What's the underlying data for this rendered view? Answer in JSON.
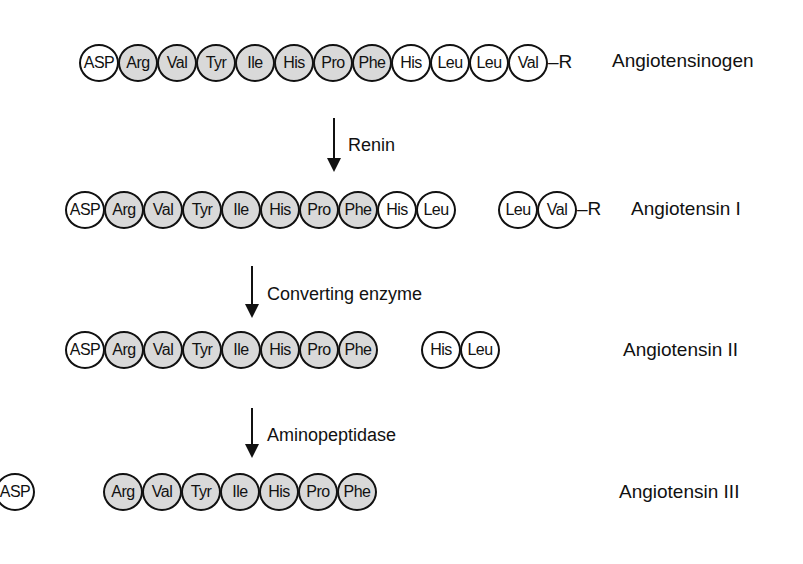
{
  "rows": [
    {
      "name": "Angiotensinogen",
      "label": "Angiotensinogen",
      "segments": [
        {
          "residues": [
            "ASP",
            "Arg",
            "Val",
            "Tyr",
            "Ile",
            "His",
            "Pro",
            "Phe",
            "His",
            "Leu",
            "Leu",
            "Val"
          ],
          "shaded": [
            false,
            true,
            true,
            true,
            true,
            true,
            true,
            true,
            false,
            false,
            false,
            false
          ],
          "tail": "–R"
        }
      ]
    },
    {
      "name": "Angiotensin I",
      "label": "Angiotensin I",
      "segments": [
        {
          "residues": [
            "ASP",
            "Arg",
            "Val",
            "Tyr",
            "Ile",
            "His",
            "Pro",
            "Phe",
            "His",
            "Leu"
          ],
          "shaded": [
            false,
            true,
            true,
            true,
            true,
            true,
            true,
            true,
            false,
            false
          ],
          "tail": ""
        },
        {
          "residues": [
            "Leu",
            "Val"
          ],
          "shaded": [
            false,
            false
          ],
          "tail": "–R"
        }
      ]
    },
    {
      "name": "Angiotensin II",
      "label": "Angiotensin II",
      "segments": [
        {
          "residues": [
            "ASP",
            "Arg",
            "Val",
            "Tyr",
            "Ile",
            "His",
            "Pro",
            "Phe"
          ],
          "shaded": [
            false,
            true,
            true,
            true,
            true,
            true,
            true,
            true
          ],
          "tail": ""
        },
        {
          "residues": [
            "His",
            "Leu"
          ],
          "shaded": [
            false,
            false
          ],
          "tail": ""
        }
      ]
    },
    {
      "name": "Angiotensin III",
      "label": "Angiotensin III",
      "segments": [
        {
          "residues": [
            "ASP"
          ],
          "shaded": [
            false
          ],
          "tail": ""
        },
        {
          "residues": [
            "Arg",
            "Val",
            "Tyr",
            "Ile",
            "His",
            "Pro",
            "Phe"
          ],
          "shaded": [
            true,
            true,
            true,
            true,
            true,
            true,
            true
          ],
          "tail": ""
        }
      ]
    }
  ],
  "enzymes": [
    "Renin",
    "Converting enzyme",
    "Aminopeptidase"
  ],
  "colors": {
    "shaded_residue": "#d9d9d9",
    "unshaded_residue": "#ffffff",
    "stroke": "#111111"
  }
}
